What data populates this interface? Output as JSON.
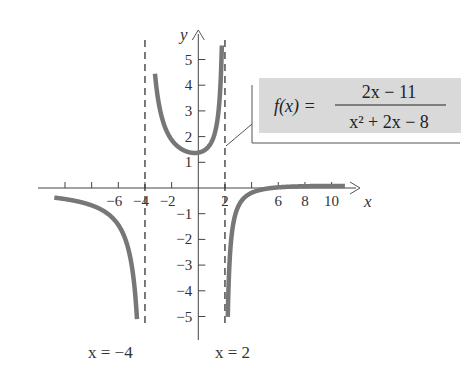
{
  "chart_data": {
    "type": "line",
    "title": "",
    "function": {
      "label_lhs": "f(x) =",
      "numerator": "2x − 11",
      "denominator": "x² + 2x −  8"
    },
    "xlabel": "x",
    "ylabel": "y",
    "xlim": [
      -11.5,
      11.5
    ],
    "ylim": [
      -5.5,
      5.5
    ],
    "grid": false,
    "x_ticks": [
      -10,
      -8,
      -6,
      -4,
      -2,
      2,
      4,
      6,
      8,
      10
    ],
    "x_tick_labels": [
      {
        "value": -6,
        "text": "−6"
      },
      {
        "value": -4,
        "text": "−4"
      },
      {
        "value": -2,
        "text": "−2"
      },
      {
        "value": 2,
        "text": "2"
      },
      {
        "value": 6,
        "text": "6"
      },
      {
        "value": 8,
        "text": "8"
      },
      {
        "value": 10,
        "text": "10"
      }
    ],
    "y_ticks": [
      -5,
      -4,
      -3,
      -2,
      -1,
      1,
      2,
      3,
      4,
      5
    ],
    "y_tick_labels": [
      {
        "value": 5,
        "text": "5"
      },
      {
        "value": 4,
        "text": "4"
      },
      {
        "value": 3,
        "text": "3"
      },
      {
        "value": 2,
        "text": "2"
      },
      {
        "value": 1,
        "text": "1"
      },
      {
        "value": -1,
        "text": "−1"
      },
      {
        "value": -2,
        "text": "−2"
      },
      {
        "value": -3,
        "text": "−3"
      },
      {
        "value": -4,
        "text": "−4"
      },
      {
        "value": -5,
        "text": "−5"
      }
    ],
    "asymptotes": [
      {
        "type": "vertical",
        "x": -4,
        "label": "x =  −4"
      },
      {
        "type": "vertical",
        "x": 2,
        "label": "x = 2"
      },
      {
        "type": "horizontal",
        "y": 0
      }
    ],
    "series": [
      {
        "name": "left branch",
        "domain": [
          -10.8,
          -4.6
        ],
        "x": [
          -10.8,
          -10,
          -9,
          -8,
          -7,
          -6,
          -5.5,
          -5,
          -4.8,
          -4.6
        ],
        "y": [
          -0.37,
          -0.43,
          -0.53,
          -0.68,
          -0.93,
          -1.44,
          -1.91,
          -3.0,
          -3.94,
          -5.1
        ]
      },
      {
        "name": "middle branch",
        "domain": [
          -3.3,
          1.95
        ],
        "x": [
          -3.3,
          -3,
          -2,
          -1,
          0,
          1,
          1.5,
          1.8,
          1.95
        ],
        "y": [
          5.8,
          3.4,
          1.88,
          1.44,
          1.38,
          1.8,
          2.91,
          5.7,
          15
        ]
      },
      {
        "name": "right branch",
        "domain": [
          2.1,
          11
        ],
        "x": [
          2.1,
          2.3,
          2.5,
          3,
          4,
          5,
          6,
          8,
          10,
          11
        ],
        "y": [
          -5.5,
          -3.9,
          -2.2,
          -0.71,
          -0.19,
          -0.0,
          0.03,
          0.07,
          0.08,
          0.08
        ]
      }
    ],
    "annotations": [
      {
        "text": "f(x) = (2x − 11)/(x² + 2x − 8)",
        "position": "upper right, boxed, with pointer to middle branch"
      }
    ],
    "colors": {
      "curve": "#777777",
      "axes": "#444444",
      "label_box": "#d9d9d9",
      "text": "#333333"
    }
  }
}
